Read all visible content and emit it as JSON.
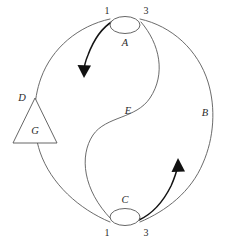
{
  "figure": {
    "kind": "knot-diagram",
    "background_color": "#ffffff",
    "line_color": "#5a5a5a",
    "arrow_color": "#111111",
    "width": 227,
    "height": 240
  },
  "nodes": [
    {
      "id": "A",
      "label": "A",
      "shape": "ellipse",
      "cx": 125,
      "cy": 25,
      "rx": 15,
      "ry": 8.5,
      "label_x": 125,
      "label_y": 46,
      "terminals": [
        {
          "label": "1",
          "x": 107,
          "y": 14
        },
        {
          "label": "3",
          "x": 146,
          "y": 14
        }
      ]
    },
    {
      "id": "C",
      "label": "C",
      "shape": "ellipse",
      "cx": 125,
      "cy": 217,
      "rx": 15,
      "ry": 8.5,
      "label_x": 125,
      "label_y": 203,
      "terminals": [
        {
          "label": "1",
          "x": 107,
          "y": 233
        },
        {
          "label": "3",
          "x": 146,
          "y": 233
        }
      ]
    },
    {
      "id": "G",
      "label": "G",
      "shape": "triangle",
      "apex_x": 35,
      "apex_y": 98,
      "base_left_x": 13,
      "base_right_x": 57,
      "base_y": 143,
      "label_x": 35,
      "label_y": 134
    }
  ],
  "edge_labels": [
    {
      "id": "B",
      "label": "B",
      "x": 205,
      "y": 116
    },
    {
      "id": "D",
      "label": "D",
      "x": 22,
      "y": 101
    },
    {
      "id": "E",
      "label": "E",
      "x": 128,
      "y": 114
    }
  ],
  "arrows": [
    {
      "id": "upper-left-arrow",
      "direction": "down-left",
      "tip_x": 84,
      "tip_y": 76
    },
    {
      "id": "lower-right-arrow",
      "direction": "up-right",
      "tip_x": 178,
      "tip_y": 160
    }
  ]
}
